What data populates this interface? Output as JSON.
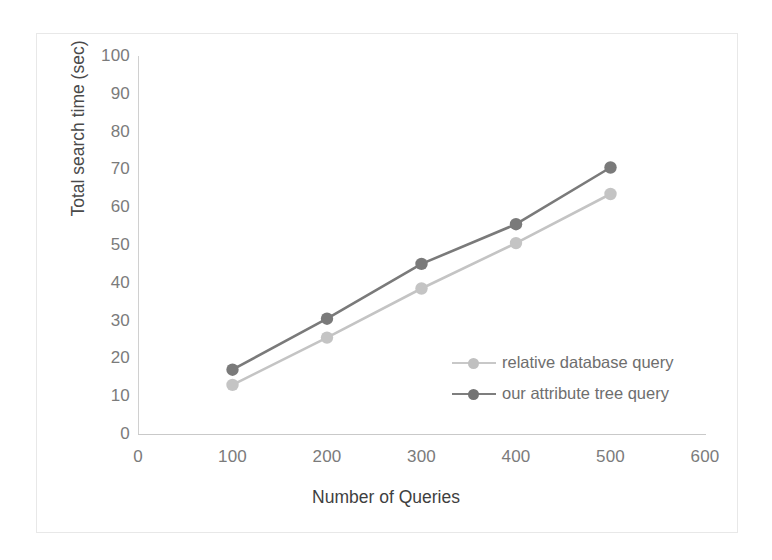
{
  "chart_data": {
    "type": "line",
    "title": "",
    "xlabel": "Number of Queries",
    "ylabel": "Total search time (sec)",
    "x": [
      100,
      200,
      300,
      400,
      500
    ],
    "xlim": [
      0,
      600
    ],
    "ylim": [
      0,
      100
    ],
    "xticks": [
      "0",
      "100",
      "200",
      "300",
      "400",
      "500",
      "600"
    ],
    "yticks": [
      "0",
      "10",
      "20",
      "30",
      "40",
      "50",
      "60",
      "70",
      "80",
      "90",
      "100"
    ],
    "grid": false,
    "legend_position": "inside-right",
    "series": [
      {
        "name": "relative database query",
        "color": "#c4c4c4",
        "marker": "circle",
        "values": [
          13,
          25.5,
          38.5,
          50.5,
          63.5
        ]
      },
      {
        "name": "our attribute tree query",
        "color": "#7a7a7a",
        "marker": "circle",
        "values": [
          17,
          30.5,
          45,
          55.5,
          70.5
        ]
      }
    ]
  },
  "axes": {
    "y_axis_title": "Total search time (sec)",
    "x_axis_title": "Number of Queries",
    "y_tick_labels": [
      "100",
      "90",
      "80",
      "70",
      "60",
      "50",
      "40",
      "30",
      "20",
      "10",
      "0"
    ],
    "x_tick_labels": [
      "0",
      "100",
      "200",
      "300",
      "400",
      "500",
      "600"
    ]
  },
  "legend": {
    "items": [
      {
        "label": "relative database query",
        "color": "#c4c4c4"
      },
      {
        "label": "our attribute tree query",
        "color": "#7a7a7a"
      }
    ]
  },
  "colors": {
    "series_light": "#c4c4c4",
    "series_dark": "#7a7a7a",
    "axis_line": "#cfcfcf",
    "tick_text": "#7b7b7b",
    "title_text": "#424242",
    "frame_border": "#e8e8e8",
    "background": "#ffffff"
  }
}
